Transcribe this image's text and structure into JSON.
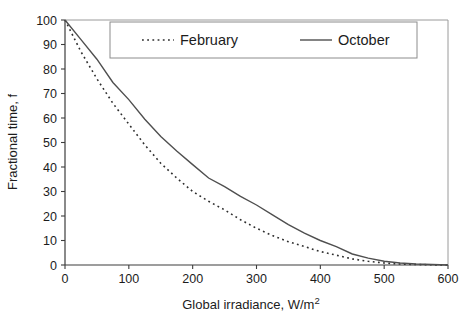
{
  "chart_data": {
    "type": "line",
    "title": "",
    "xlabel": "Global irradiance, W/m",
    "xlabel_superscript": "2",
    "ylabel": "Fractional time, f",
    "xlim": [
      0,
      600
    ],
    "ylim": [
      0,
      100
    ],
    "x_ticks": [
      0,
      100,
      200,
      300,
      400,
      500,
      600
    ],
    "y_ticks": [
      0,
      10,
      20,
      30,
      40,
      50,
      60,
      70,
      80,
      90,
      100
    ],
    "grid": false,
    "legend_position": "top-inside",
    "x": [
      0,
      25,
      50,
      75,
      100,
      125,
      150,
      175,
      200,
      225,
      250,
      275,
      300,
      325,
      350,
      375,
      400,
      425,
      450,
      475,
      500,
      525,
      550,
      575,
      600
    ],
    "series": [
      {
        "name": "February",
        "style": "dotted",
        "values": [
          100,
          87,
          76,
          66,
          57.5,
          49,
          41.5,
          35.5,
          30,
          26,
          22.5,
          18.5,
          15,
          12,
          9.5,
          7.5,
          5.5,
          4,
          2.5,
          1.5,
          0.8,
          0.4,
          0.2,
          0.1,
          0
        ]
      },
      {
        "name": "October",
        "style": "solid",
        "values": [
          100,
          92,
          84,
          74.5,
          67.5,
          59.5,
          52.5,
          46.5,
          41,
          35.5,
          32,
          28,
          24.5,
          20.5,
          16.5,
          13,
          10,
          7.5,
          4.5,
          2.8,
          1.5,
          0.8,
          0.4,
          0.2,
          0
        ]
      }
    ]
  },
  "colors": {
    "background": "#ffffff",
    "axis": "#3c3c3c",
    "frame": "#9a9a9a",
    "solid_curve": "#4f4f4f",
    "dotted_curve": "#2e2e2e",
    "text": "#1c1c1c",
    "legend_border": "#8c8c8c"
  }
}
